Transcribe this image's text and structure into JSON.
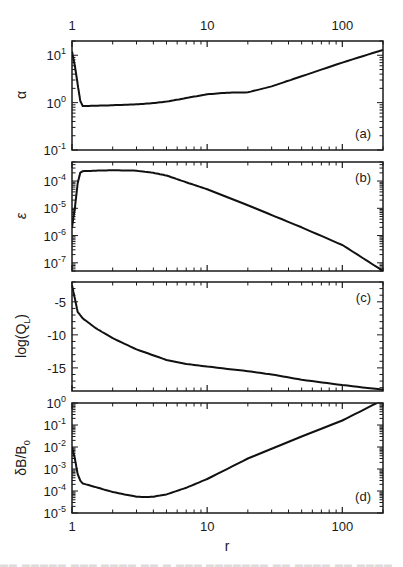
{
  "figure": {
    "top_axis_ticks": [
      "1",
      "10",
      "100"
    ],
    "bottom_axis_ticks": [
      "1",
      "10",
      "100"
    ],
    "xlabel": "r",
    "caption_partial": "(faint, cut-off caption text)"
  },
  "chart_data": [
    {
      "type": "line",
      "panel": "(a)",
      "ylabel": "α",
      "xscale": "log",
      "yscale": "log",
      "xlim": [
        1,
        200
      ],
      "ylim": [
        0.1,
        20
      ],
      "yticks": [
        "10^-1",
        "10^0",
        "10^1"
      ],
      "x": [
        1.0,
        1.05,
        1.1,
        1.15,
        1.2,
        1.5,
        2,
        3,
        4,
        5,
        7,
        10,
        14,
        20,
        30,
        50,
        100,
        200
      ],
      "y": [
        12,
        6,
        2.5,
        1.1,
        0.85,
        0.86,
        0.88,
        0.92,
        0.98,
        1.05,
        1.25,
        1.5,
        1.62,
        1.65,
        2.2,
        3.6,
        7.0,
        13
      ]
    },
    {
      "type": "line",
      "panel": "(b)",
      "ylabel": "ε",
      "xscale": "log",
      "yscale": "log",
      "xlim": [
        1,
        200
      ],
      "ylim": [
        5e-08,
        0.0005
      ],
      "yticks": [
        "10^-7",
        "10^-6",
        "10^-5",
        "10^-4"
      ],
      "x": [
        1.0,
        1.05,
        1.1,
        1.15,
        1.2,
        1.5,
        2,
        3,
        4,
        5,
        7,
        10,
        20,
        50,
        100,
        200
      ],
      "y": [
        2e-06,
        1e-05,
        8e-05,
        0.0002,
        0.00023,
        0.00024,
        0.00025,
        0.00024,
        0.0002,
        0.00016,
        9e-05,
        5e-05,
        1.3e-05,
        2e-06,
        4.5e-07,
        5e-08
      ]
    },
    {
      "type": "line",
      "panel": "(c)",
      "ylabel": "log(Q_L)",
      "xscale": "log",
      "yscale": "linear",
      "xlim": [
        1,
        200
      ],
      "ylim": [
        -18.5,
        -2
      ],
      "yticks": [
        "-15",
        "-10",
        "-5"
      ],
      "x": [
        1.0,
        1.05,
        1.1,
        1.2,
        1.5,
        2,
        3,
        5,
        7,
        10,
        20,
        30,
        50,
        100,
        200
      ],
      "y": [
        -2.5,
        -4.5,
        -6.5,
        -7.5,
        -9.0,
        -10.5,
        -12.2,
        -13.8,
        -14.4,
        -14.8,
        -15.5,
        -16.0,
        -16.8,
        -17.6,
        -18.3
      ]
    },
    {
      "type": "line",
      "panel": "(d)",
      "ylabel": "δB/B_0",
      "xscale": "log",
      "yscale": "log",
      "xlim": [
        1,
        200
      ],
      "ylim": [
        1e-05,
        1
      ],
      "yticks": [
        "10^-5",
        "10^-4",
        "10^-3",
        "10^-2",
        "10^-1",
        "10^0"
      ],
      "x": [
        1.0,
        1.05,
        1.1,
        1.15,
        1.2,
        1.5,
        2,
        3,
        3.5,
        4,
        5,
        7,
        10,
        20,
        50,
        100,
        180
      ],
      "y": [
        0.01,
        0.003,
        0.0006,
        0.0003,
        0.00022,
        0.00015,
        9e-05,
        5.5e-05,
        5.3e-05,
        5.5e-05,
        7e-05,
        0.00014,
        0.00035,
        0.003,
        0.03,
        0.16,
        1
      ]
    }
  ]
}
